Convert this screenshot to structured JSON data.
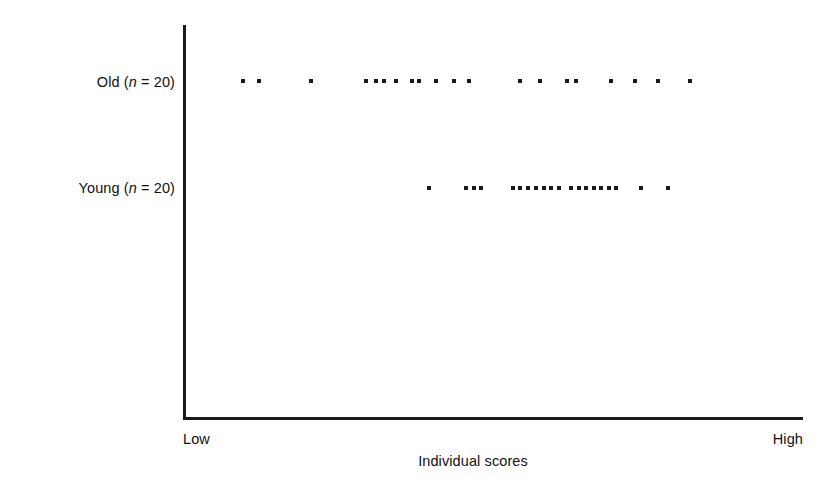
{
  "chart_data": {
    "type": "scatter",
    "title": "",
    "subtitle": "",
    "xlabel": "Individual scores",
    "ylabel": "",
    "grid": false,
    "legend": "none",
    "x_axis": {
      "tick_labels": [
        "Low",
        "High"
      ],
      "range_description": "Low to High (unscaled individual scores)",
      "pixel_start": 183,
      "pixel_end": 803
    },
    "y_axis": {
      "categories": [
        "Old (n = 20)",
        "Young (n = 20)"
      ],
      "tick_labels": [
        "Old (n = 20)",
        "Young (n = 20)"
      ]
    },
    "series": [
      {
        "name": "Old (n = 20)",
        "count": 20,
        "row_y": 81,
        "x_pixels": [
          243,
          259,
          311,
          366,
          376,
          384,
          396,
          412,
          419,
          436,
          454,
          469,
          520,
          540,
          567,
          576,
          611,
          635,
          658,
          690
        ],
        "x_normalized": [
          0.097,
          0.123,
          0.206,
          0.295,
          0.311,
          0.324,
          0.344,
          0.369,
          0.381,
          0.408,
          0.437,
          0.461,
          0.544,
          0.576,
          0.619,
          0.634,
          0.69,
          0.729,
          0.766,
          0.818
        ]
      },
      {
        "name": "Young (n = 20)",
        "count": 20,
        "row_y": 188,
        "x_pixels": [
          429,
          466,
          474,
          481,
          513,
          520,
          528,
          536,
          544,
          551,
          559,
          571,
          579,
          586,
          594,
          601,
          609,
          616,
          641,
          668
        ],
        "x_normalized": [
          0.397,
          0.456,
          0.469,
          0.481,
          0.532,
          0.544,
          0.556,
          0.569,
          0.582,
          0.594,
          0.606,
          0.626,
          0.639,
          0.65,
          0.663,
          0.674,
          0.687,
          0.698,
          0.739,
          0.782
        ]
      }
    ],
    "colors": {
      "dot": "#1a1a1a",
      "axis": "#1a1a1a",
      "background": "#ffffff",
      "text": "#111111"
    }
  },
  "labels": {
    "old": {
      "prefix": "Old (",
      "italic": "n",
      "suffix": " = 20)"
    },
    "young": {
      "prefix": "Young (",
      "italic": "n",
      "suffix": " = 20)"
    },
    "low": "Low",
    "high": "High",
    "x_axis_title": "Individual scores"
  }
}
